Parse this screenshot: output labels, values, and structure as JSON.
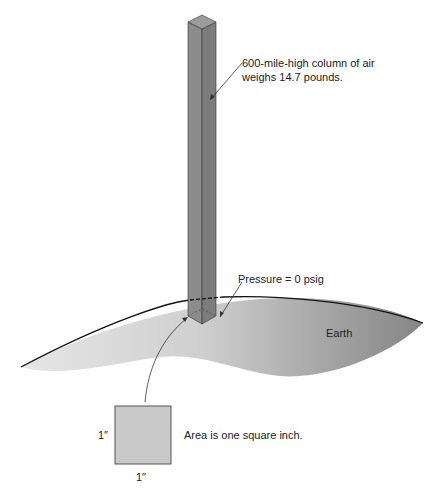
{
  "diagram": {
    "column_label_line1": "600-mile-high column of air",
    "column_label_line2": "weighs 14.7 pounds.",
    "pressure_label": "Pressure = 0 psig",
    "earth_label": "Earth",
    "area_label": "Area is one square inch.",
    "side_label": "1″",
    "bottom_label": "1″",
    "colors": {
      "column_left_face": "#8a8a8a",
      "column_right_face": "#7a7a7a",
      "column_top": "#9a9a9a",
      "earth_light": "#e4e4e4",
      "earth_dark": "#8e8e8e",
      "square_fill": "#c8c8c8",
      "outline": "#333333"
    }
  }
}
